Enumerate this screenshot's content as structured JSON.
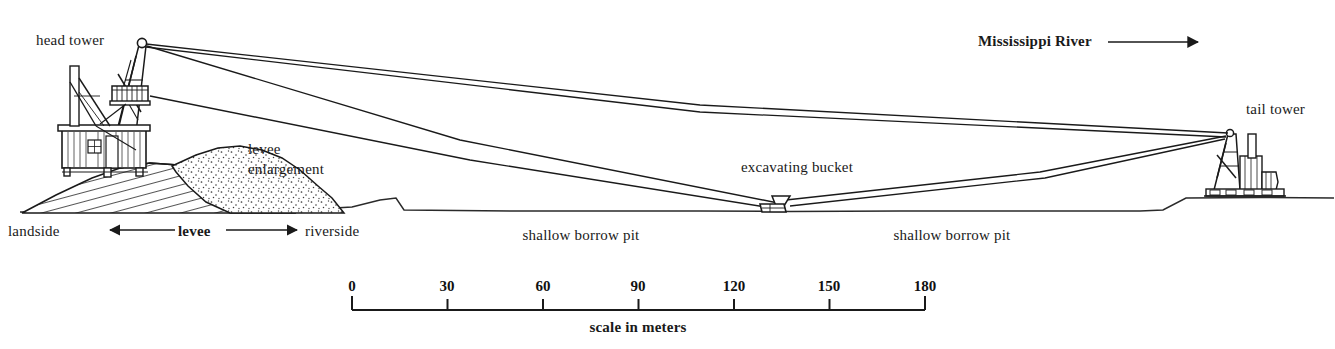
{
  "figure": {
    "background_color": "#ffffff",
    "ink_color": "#1a1a1a"
  },
  "labels": {
    "head_tower": "head tower",
    "tail_tower": "tail tower",
    "excavating_bucket": "excavating bucket",
    "levee_enlargement_line1": "levee",
    "levee_enlargement_line2": "enlargement",
    "mississippi_river": "Mississippi River",
    "landside": "landside",
    "levee": "levee",
    "riverside": "riverside",
    "shallow_borrow_pit_left": "shallow borrow pit",
    "shallow_borrow_pit_right": "shallow borrow pit"
  },
  "scale": {
    "caption": "scale in meters",
    "units": "meters",
    "ticks": [
      "0",
      "30",
      "60",
      "90",
      "120",
      "150",
      "180"
    ],
    "min": 0,
    "max": 180,
    "step": 30
  },
  "flow_arrow": {
    "direction": "right",
    "meaning": "river flow direction"
  },
  "cross_section_arrows": {
    "left": "left",
    "right": "right"
  }
}
